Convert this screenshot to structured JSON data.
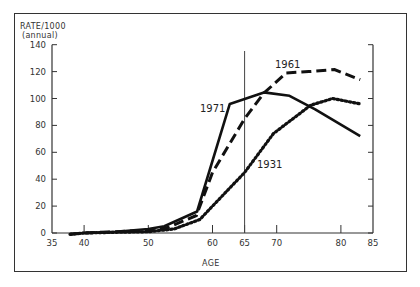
{
  "chart_data": {
    "type": "line",
    "title": "",
    "xlabel": "AGE",
    "ylabel": "RATE/1000",
    "ylabel_sub": "(annual)",
    "xlim": [
      35,
      85
    ],
    "ylim": [
      0,
      140
    ],
    "x_ticks": [
      35,
      40,
      50,
      60,
      65,
      70,
      80,
      85
    ],
    "y_ticks": [
      0,
      20,
      40,
      60,
      80,
      100,
      120,
      140
    ],
    "grid": false,
    "legend": "inline labels",
    "reference_line": {
      "x": 65,
      "orientation": "vertical"
    },
    "series": [
      {
        "name": "1971",
        "style": "solid",
        "x": [
          37.8,
          40,
          45,
          50,
          52.5,
          57.6,
          62.7,
          68,
          72,
          76,
          83
        ],
        "values": [
          -1,
          0,
          1,
          3,
          5,
          16,
          96,
          104.5,
          102,
          92,
          72
        ]
      },
      {
        "name": "1961",
        "style": "dashed",
        "x": [
          37.8,
          40,
          45,
          50,
          53,
          57.5,
          60,
          65,
          68,
          71.5,
          75,
          79,
          83
        ],
        "values": [
          -1,
          0,
          1,
          2,
          4,
          13,
          45,
          85,
          104,
          119,
          120,
          121.5,
          114
        ]
      },
      {
        "name": "1931",
        "style": "dotted",
        "x": [
          37.8,
          40,
          45,
          50,
          54,
          58,
          62,
          65,
          69.5,
          75.3,
          78.7,
          83
        ],
        "values": [
          -1,
          0,
          0.5,
          1,
          3,
          10,
          30,
          45,
          74,
          95,
          100,
          96
        ]
      }
    ]
  },
  "labels": {
    "y_title": "RATE/1000",
    "y_subtitle": "(annual)",
    "x_title": "AGE",
    "series_1971": "1971",
    "series_1961": "1961",
    "series_1931": "1931",
    "y_ticks": [
      "140",
      "120",
      "100",
      "80",
      "60",
      "40",
      "20",
      "0"
    ],
    "x_ticks": [
      "35",
      "40",
      "50",
      "60",
      "65",
      "70",
      "80",
      "85"
    ]
  }
}
